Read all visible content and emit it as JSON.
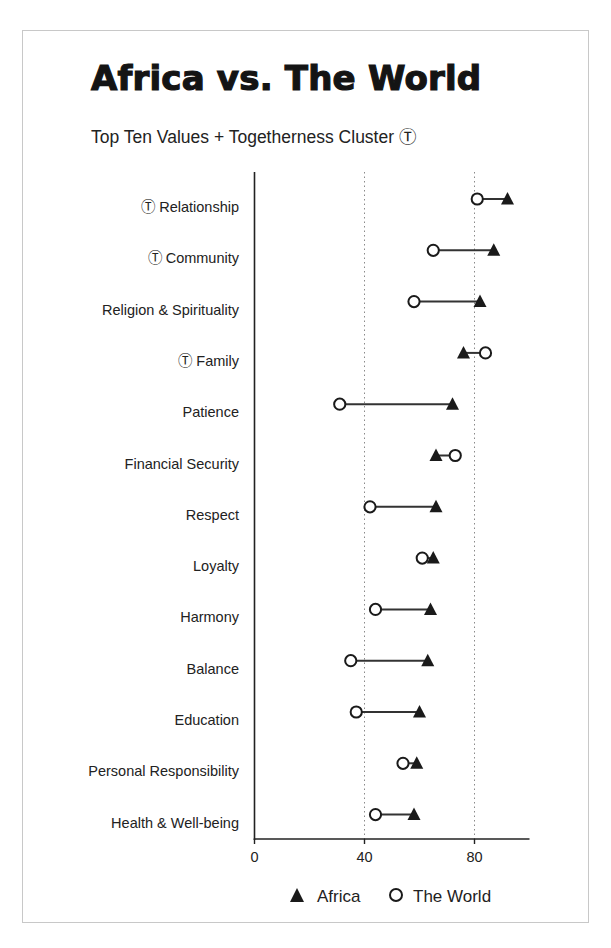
{
  "chart": {
    "title": "Africa vs. The World",
    "subtitle": "Top Ten Values + Togetherness Cluster Ⓣ"
  },
  "chart_data": {
    "type": "dumbbell",
    "title": "Africa vs. The World",
    "subtitle": "Top Ten Values + Togetherness Cluster Ⓣ",
    "xlabel": "",
    "ylabel": "",
    "xlim": [
      0,
      100
    ],
    "xticks": [
      0,
      40,
      80
    ],
    "grid": {
      "vertical_dotted_at": [
        40,
        80
      ]
    },
    "togetherness_marker": "Ⓣ",
    "categories": [
      "Relationship",
      "Community",
      "Religion & Spirituality",
      "Family",
      "Patience",
      "Financial Security",
      "Respect",
      "Loyalty",
      "Harmony",
      "Balance",
      "Education",
      "Personal Responsibility",
      "Health & Well-being"
    ],
    "togetherness_flags": [
      true,
      true,
      false,
      true,
      false,
      false,
      false,
      false,
      false,
      false,
      false,
      false,
      false
    ],
    "series": [
      {
        "name": "Africa",
        "marker": "filled-triangle",
        "values": [
          92,
          87,
          82,
          76,
          72,
          66,
          66,
          65,
          64,
          63,
          60,
          59,
          58
        ]
      },
      {
        "name": "The World",
        "marker": "open-circle",
        "values": [
          81,
          65,
          58,
          84,
          31,
          73,
          42,
          61,
          44,
          35,
          37,
          54,
          44
        ]
      }
    ],
    "legend": {
      "position": "bottom",
      "entries": [
        "Africa",
        "The World"
      ]
    }
  }
}
